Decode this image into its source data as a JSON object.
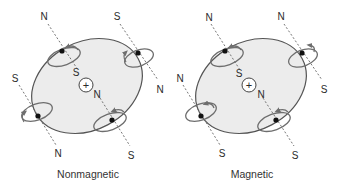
{
  "colors": {
    "atom_fill": "#ececec",
    "outline": "#555555",
    "orbit": "#6e6e6e",
    "axis": "#666666",
    "electron": "#111111",
    "text": "#2a2a2a"
  },
  "panels": [
    {
      "caption": "Nonmagnetic",
      "nucleus_symbol": "+",
      "electrons": [
        {
          "position": "top-left",
          "pole_outer": "N",
          "pole_inner": "S"
        },
        {
          "position": "top-right",
          "pole_outer": "S",
          "pole_inner": "N"
        },
        {
          "position": "bottom-left",
          "pole_outer": "S",
          "pole_inner": "N"
        },
        {
          "position": "bottom-right",
          "pole_inner": "N",
          "pole_outer": "S"
        }
      ]
    },
    {
      "caption": "Magnetic",
      "nucleus_symbol": "+",
      "electrons": [
        {
          "position": "top-left",
          "pole_outer": "N",
          "pole_inner": "S"
        },
        {
          "position": "top-right",
          "pole_outer": "N",
          "pole_inner": "S"
        },
        {
          "position": "bottom-left",
          "pole_outer": "N",
          "pole_inner": "S"
        },
        {
          "position": "bottom-right",
          "pole_inner": "N",
          "pole_outer": "S"
        }
      ]
    }
  ]
}
